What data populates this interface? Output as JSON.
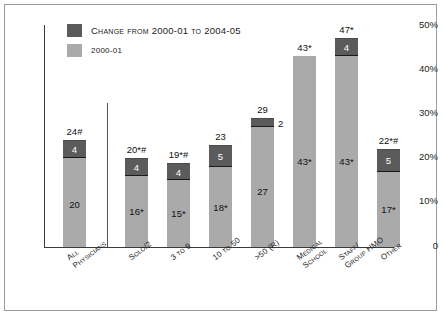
{
  "chart_data": {
    "type": "bar",
    "stacked": true,
    "title": "",
    "subtitle": "",
    "xlabel": "",
    "ylabel": "",
    "ylim": [
      0,
      50
    ],
    "yticks": [
      "0",
      "10%",
      "20%",
      "30%",
      "40%",
      "50%"
    ],
    "ytick_values": [
      0,
      10,
      20,
      30,
      40,
      50
    ],
    "grid": false,
    "legend_position": "top-left",
    "legend": [
      {
        "name": "Change from 2000-01 to 2004-05",
        "color": "#5b5b5b"
      },
      {
        "name": "2000-01",
        "color": "#aaaaaa"
      }
    ],
    "categories": [
      "All Physicians",
      "Solo/2",
      "3 to 9",
      "10 to 50",
      ">50 (R)",
      "Medical School",
      "Staff/ Group HMO",
      "Other"
    ],
    "series": [
      {
        "name": "2000-01",
        "color": "#aaaaaa",
        "values": [
          20,
          16,
          15,
          18,
          27,
          43,
          43,
          17
        ],
        "labels": [
          "20",
          "16*",
          "15*",
          "18*",
          "27",
          "43*",
          "43*",
          "17*"
        ]
      },
      {
        "name": "Change from 2000-01 to 2004-05",
        "color": "#5b5b5b",
        "values": [
          4,
          4,
          4,
          5,
          2,
          0,
          4,
          5
        ],
        "labels": [
          "4",
          "4",
          "4",
          "5",
          "2",
          "",
          "4",
          "5"
        ]
      }
    ],
    "totals": [
      24,
      20,
      19,
      23,
      29,
      43,
      47,
      22
    ],
    "total_labels": [
      "24#",
      "20*#",
      "19*#",
      "23",
      "29",
      "43*",
      "47*",
      "22*#"
    ]
  },
  "axis": {
    "y_ticks": [
      {
        "label": "50%"
      },
      {
        "label": "40%"
      },
      {
        "label": "30%"
      },
      {
        "label": "20%"
      },
      {
        "label": "10%"
      },
      {
        "label": "0"
      }
    ]
  },
  "legend": {
    "change_label": "Change from 2000-01 to 2004-05",
    "baseline_label": "2000-01"
  },
  "bars": [
    {
      "category_lines": [
        "All",
        "Physicians"
      ],
      "total_label": "24#",
      "base_label": "20",
      "change_label": "4",
      "base_value": 20,
      "change_value": 4
    },
    {
      "category_lines": [
        "Solo/2"
      ],
      "total_label": "20*#",
      "base_label": "16*",
      "change_label": "4",
      "base_value": 16,
      "change_value": 4
    },
    {
      "category_lines": [
        "3 to 9"
      ],
      "total_label": "19*#",
      "base_label": "15*",
      "change_label": "4",
      "base_value": 15,
      "change_value": 4
    },
    {
      "category_lines": [
        "10 to 50"
      ],
      "total_label": "23",
      "base_label": "18*",
      "change_label": "5",
      "base_value": 18,
      "change_value": 5
    },
    {
      "category_lines": [
        ">50 (R)"
      ],
      "total_label": "29",
      "base_label": "27",
      "change_label": "2",
      "base_value": 27,
      "change_value": 2
    },
    {
      "category_lines": [
        "Medical",
        "School"
      ],
      "total_label": "43*",
      "base_label": "43*",
      "change_label": "",
      "base_value": 43,
      "change_value": 0
    },
    {
      "category_lines": [
        "Staff/",
        "Group HMO"
      ],
      "total_label": "47*",
      "base_label": "43*",
      "change_label": "4",
      "base_value": 43,
      "change_value": 4
    },
    {
      "category_lines": [
        "Other"
      ],
      "total_label": "22*#",
      "base_label": "17*",
      "change_label": "5",
      "base_value": 17,
      "change_value": 5
    }
  ],
  "colors": {
    "bar_base": "#aaaaaa",
    "bar_change": "#5b5b5b",
    "axis": "#3a3a3a",
    "text": "#111111",
    "frame": "#9a9a9a"
  }
}
